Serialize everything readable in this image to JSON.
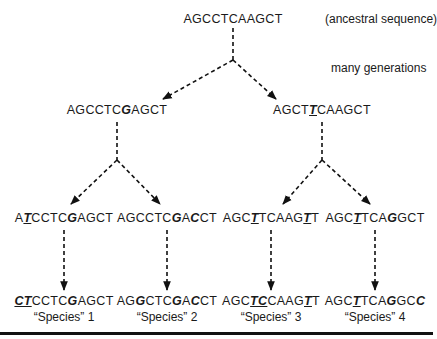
{
  "diagram": {
    "root": {
      "sequence": "AGCCTCAAGCT",
      "annotation": "(ancestral sequence)"
    },
    "time_note": "many generations",
    "level2": [
      {
        "parts": [
          {
            "t": "AGCCTC"
          },
          {
            "t": "G",
            "mut": true,
            "ul": false
          },
          {
            "t": "AGCT"
          }
        ]
      },
      {
        "parts": [
          {
            "t": "AGCT"
          },
          {
            "t": "T",
            "mut": true,
            "ul": true
          },
          {
            "t": "CAAGCT"
          }
        ]
      }
    ],
    "level3": [
      {
        "parts": [
          {
            "t": "A"
          },
          {
            "t": "T",
            "mut": true,
            "ul": true
          },
          {
            "t": "CCTC"
          },
          {
            "t": "G",
            "mut": true,
            "ul": false
          },
          {
            "t": "AGCT"
          }
        ]
      },
      {
        "parts": [
          {
            "t": "AGCCTC"
          },
          {
            "t": "G",
            "mut": true,
            "ul": false
          },
          {
            "t": "A"
          },
          {
            "t": "C",
            "mut": true,
            "ul": false
          },
          {
            "t": "CT"
          }
        ]
      },
      {
        "parts": [
          {
            "t": "AGC"
          },
          {
            "t": "T",
            "mut": true,
            "ul": true
          },
          {
            "t": "TCAAG"
          },
          {
            "t": "T",
            "mut": true,
            "ul": true
          },
          {
            "t": "T"
          }
        ]
      },
      {
        "parts": [
          {
            "t": "AGC"
          },
          {
            "t": "T",
            "mut": true,
            "ul": true
          },
          {
            "t": "TCA"
          },
          {
            "t": "G",
            "mut": true,
            "ul": false
          },
          {
            "t": "GCT"
          }
        ]
      }
    ],
    "species": [
      {
        "parts": [
          {
            "t": "CT",
            "mut": true,
            "ul": true
          },
          {
            "t": "CCTC"
          },
          {
            "t": "G",
            "mut": true,
            "ul": false
          },
          {
            "t": "AGCT"
          }
        ],
        "label": "“Species” 1"
      },
      {
        "parts": [
          {
            "t": "AG"
          },
          {
            "t": "G",
            "mut": true,
            "ul": false
          },
          {
            "t": "CTC"
          },
          {
            "t": "G",
            "mut": true,
            "ul": false
          },
          {
            "t": "A"
          },
          {
            "t": "C",
            "mut": true,
            "ul": false
          },
          {
            "t": "CT"
          }
        ],
        "label": "“Species” 2"
      },
      {
        "parts": [
          {
            "t": "AGC"
          },
          {
            "t": "TC",
            "mut": true,
            "ul": true
          },
          {
            "t": "CAAG"
          },
          {
            "t": "T",
            "mut": true,
            "ul": true
          },
          {
            "t": "T"
          }
        ],
        "label": "“Species” 3"
      },
      {
        "parts": [
          {
            "t": "AGC"
          },
          {
            "t": "T",
            "mut": true,
            "ul": true
          },
          {
            "t": "TCA"
          },
          {
            "t": "G",
            "mut": true,
            "ul": false
          },
          {
            "t": "GC"
          },
          {
            "t": "C",
            "mut": true,
            "ul": false
          }
        ],
        "label": "“Species” 4"
      }
    ],
    "colors": {
      "ink": "#1a1a1a",
      "background": "#ffffff"
    }
  }
}
